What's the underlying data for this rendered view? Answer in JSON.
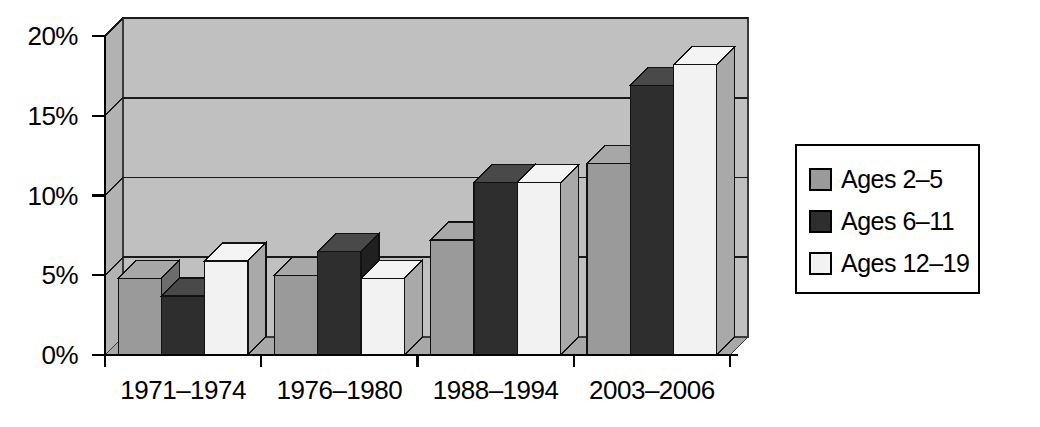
{
  "chart_data": {
    "type": "bar",
    "title": "",
    "subtitle": "",
    "xlabel": "",
    "ylabel": "",
    "categories": [
      "1971–1974",
      "1976–1980",
      "1988–1994",
      "2003–2006"
    ],
    "series": [
      {
        "name": "Ages 2–5",
        "color": "#9a9a9a",
        "values": [
          4.8,
          5.0,
          7.2,
          12.0
        ]
      },
      {
        "name": "Ages 6–11",
        "color": "#2e2e2e",
        "values": [
          3.7,
          6.5,
          10.8,
          16.9
        ]
      },
      {
        "name": "Ages 12–19",
        "color": "#f2f2f2",
        "values": [
          5.9,
          4.8,
          10.8,
          18.2
        ]
      }
    ],
    "ylim": [
      0,
      20
    ],
    "yticks": [
      0,
      5,
      10,
      15,
      20
    ],
    "ytick_labels": [
      "0%",
      "5%",
      "10%",
      "15%",
      "20%"
    ],
    "grid": true,
    "grid_axis": "y",
    "legend_position": "right-outside",
    "style": "3d-clustered-column",
    "plot_background": "#c0c0c0"
  },
  "yaxis": {
    "ticks": [
      {
        "label": "20%",
        "value": 20
      },
      {
        "label": "15%",
        "value": 15
      },
      {
        "label": "10%",
        "value": 10
      },
      {
        "label": "5%",
        "value": 5
      },
      {
        "label": "0%",
        "value": 0
      }
    ]
  },
  "xaxis": {
    "ticks": [
      {
        "label": "1971–1974"
      },
      {
        "label": "1976–1980"
      },
      {
        "label": "1988–1994"
      },
      {
        "label": "2003–2006"
      }
    ]
  },
  "legend": {
    "items": [
      {
        "label": "Ages 2–5",
        "color": "#9a9a9a"
      },
      {
        "label": "Ages 6–11",
        "color": "#2e2e2e"
      },
      {
        "label": "Ages 12–19",
        "color": "#f2f2f2"
      }
    ]
  },
  "colors": {
    "series_1": "#9a9a9a",
    "series_2": "#2e2e2e",
    "series_3": "#f2f2f2",
    "plot_wall": "#c0c0c0",
    "plot_wall_shade": "#b2b2b2",
    "floor": "#a8a8a8",
    "axis": "#000000"
  }
}
